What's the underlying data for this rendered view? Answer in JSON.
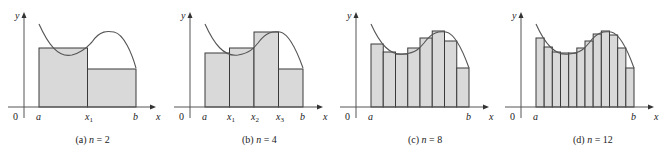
{
  "figure": {
    "colors": {
      "fill": "#d9d9d9",
      "stroke": "#3a3a3a",
      "axis": "#555555",
      "curve": "#555555"
    },
    "axis_labels": {
      "x": "x",
      "y": "y",
      "origin": "0"
    },
    "panels": [
      {
        "id": "a",
        "caption_prefix": "(a) ",
        "caption_var": "n",
        "caption_eq": " = 2",
        "n": 2,
        "origin_x": 24,
        "a_x": 39,
        "b_x": 136,
        "tick_labels": [
          {
            "x": 39,
            "base": "a",
            "sub": ""
          },
          {
            "x": 88,
            "base": "x",
            "sub": "1"
          },
          {
            "x": 136,
            "base": "b",
            "sub": ""
          }
        ],
        "rect_tops": [
          48,
          69
        ],
        "curve": "M39,24 C48,44 58,58 72,55 C84,52 88,46 92,42 C100,30 108,31 114,32 C124,34 132,54 136,68"
      },
      {
        "id": "b",
        "caption_prefix": "(b) ",
        "caption_var": "n",
        "caption_eq": " = 4",
        "n": 4,
        "origin_x": 190,
        "a_x": 205,
        "b_x": 303,
        "tick_labels": [
          {
            "x": 205,
            "base": "a",
            "sub": ""
          },
          {
            "x": 230,
            "base": "x",
            "sub": "1"
          },
          {
            "x": 254,
            "base": "x",
            "sub": "2"
          },
          {
            "x": 279,
            "base": "x",
            "sub": "3"
          },
          {
            "x": 303,
            "base": "b",
            "sub": ""
          }
        ],
        "rect_tops": [
          53,
          48,
          32,
          69
        ],
        "curve": "M205,24 C214,44 224,57 238,55 C250,53 254,48 258,43 C266,32 273,31 280,32 C290,34 298,54 303,68"
      },
      {
        "id": "c",
        "caption_prefix": "(c) ",
        "caption_var": "n",
        "caption_eq": " = 8",
        "n": 8,
        "origin_x": 356,
        "a_x": 371,
        "b_x": 469,
        "tick_labels": [
          {
            "x": 371,
            "base": "a",
            "sub": ""
          },
          {
            "x": 469,
            "base": "b",
            "sub": ""
          }
        ],
        "rect_tops": [
          44,
          52,
          54,
          48,
          38,
          31,
          41,
          68
        ],
        "curve": "M371,24 C380,44 390,56 404,54 C416,53 420,48 424,43 C432,32 439,31 446,32 C456,34 464,54 469,68"
      },
      {
        "id": "d",
        "caption_prefix": "(d) ",
        "caption_var": "n",
        "caption_eq": " = 12",
        "n": 12,
        "origin_x": 521,
        "a_x": 536,
        "b_x": 634,
        "tick_labels": [
          {
            "x": 536,
            "base": "a",
            "sub": ""
          },
          {
            "x": 634,
            "base": "b",
            "sub": ""
          }
        ],
        "rect_tops": [
          38,
          47,
          52,
          53,
          53,
          48,
          41,
          34,
          31,
          35,
          48,
          68
        ],
        "curve": "M536,24 C545,44 555,56 569,54 C581,53 585,48 589,43 C597,32 604,31 611,32 C621,34 629,54 634,68"
      }
    ],
    "layout": {
      "x_axis_y": 107,
      "y_axis_top": 12,
      "y_axis_bottom": 118,
      "tick_label_y": 120,
      "caption_y": 143
    }
  }
}
